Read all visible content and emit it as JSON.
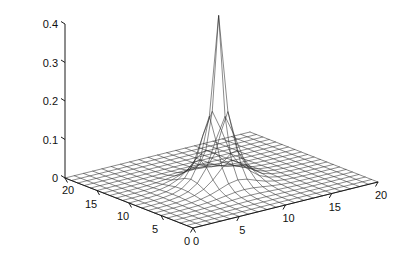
{
  "figure": {
    "background": "#ffffff",
    "line_color": "#2b2b2b",
    "axis_color": "#1a1a1a",
    "width": 420,
    "height": 276
  },
  "chart_data": {
    "type": "surface",
    "render_style": "mesh",
    "title": "",
    "xlabel": "",
    "ylabel": "",
    "zlabel": "",
    "xlim": [
      0,
      20
    ],
    "ylim": [
      0,
      20
    ],
    "zlim": [
      0,
      0.4
    ],
    "grid": false,
    "legend": null,
    "x_ticks": [
      0,
      5,
      10,
      15,
      20
    ],
    "x_tick_labels": [
      "0",
      "5",
      "10",
      "15",
      "20"
    ],
    "y_ticks": [
      0,
      5,
      10,
      15,
      20
    ],
    "y_tick_labels": [
      "0",
      "5",
      "10",
      "15",
      "20"
    ],
    "z_ticks": [
      0,
      0.1,
      0.2,
      0.3,
      0.4
    ],
    "z_tick_labels": [
      "0",
      "0.1",
      "0.2",
      "0.3",
      "0.4"
    ],
    "z_max_visible": 0.44,
    "grid_divisions": 20,
    "peak": {
      "x": 9.0,
      "y": 9.0,
      "z": 0.44
    },
    "surface_model": {
      "description": "sharp exponential peak on flat base",
      "form": "z = A * exp(-((x-x0)^2+(y-y0)^2)^0.5 / s) with sharp cusp",
      "amplitude": 0.44,
      "decay": 1.15,
      "x0": 9.0,
      "y0": 9.0
    },
    "z_values_note": "20x20 mesh sampled from the surface model; peak 0.44 at (9,9), falling to ~0 at the plot edges"
  },
  "axes": {
    "z_axis_name": "vertical-value-axis",
    "x_axis_name": "horizontal-front-right-axis",
    "y_axis_name": "horizontal-front-left-axis"
  }
}
